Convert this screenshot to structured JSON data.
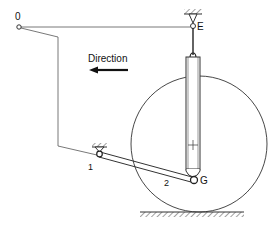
{
  "diagram": {
    "labels": {
      "point_o": "0",
      "point_e": "E",
      "point_g": "G",
      "pin_1": "1",
      "link_2": "2",
      "direction": "Direction"
    },
    "direction_arrow": "left",
    "colors": {
      "stroke": "#333333",
      "background": "#ffffff"
    }
  }
}
